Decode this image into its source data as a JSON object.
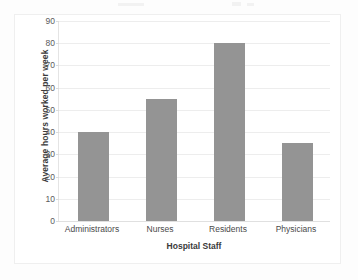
{
  "chart_data": {
    "type": "bar",
    "title": "",
    "categories": [
      "Administrators",
      "Nurses",
      "Residents",
      "Physicians"
    ],
    "values": [
      40,
      55,
      80,
      35
    ],
    "xlabel": "Hospital Staff",
    "ylabel": "Average hours worked per week",
    "ylim": [
      0,
      90
    ],
    "ytick_step": 10,
    "yticks": [
      90,
      80,
      70,
      60,
      50,
      40,
      30,
      20,
      10,
      0
    ],
    "ytick_labels": [
      "90",
      "80",
      "70",
      "60",
      "50",
      "40",
      "30",
      "20",
      "10",
      "0"
    ],
    "grid": true,
    "grid_axis": "y",
    "legend": false,
    "bar_color": "#949494",
    "gridline_color": "#ededed",
    "frame_color": "#efefef",
    "background_color": "#ffffff"
  }
}
